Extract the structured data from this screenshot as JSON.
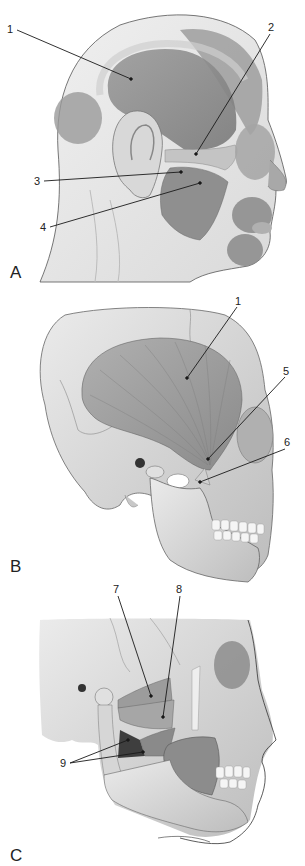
{
  "figure": {
    "panels": [
      {
        "id": "A",
        "label": "A",
        "description": "Lateral view of the head showing superficial facial muscles",
        "callouts": [
          {
            "number": "1",
            "x": 7,
            "y": 26,
            "target_x": 131,
            "target_y": 79
          },
          {
            "number": "2",
            "x": 268,
            "y": 26,
            "target_x": 196,
            "target_y": 154
          },
          {
            "number": "3",
            "x": 36,
            "y": 180,
            "target_x": 181,
            "target_y": 172
          },
          {
            "number": "4",
            "x": 42,
            "y": 227,
            "target_x": 200,
            "target_y": 183
          }
        ]
      },
      {
        "id": "B",
        "label": "B",
        "description": "Lateral view of the skull showing temporalis muscle",
        "callouts": [
          {
            "number": "1",
            "x": 236,
            "y": 298,
            "target_x": 187,
            "target_y": 378
          },
          {
            "number": "5",
            "x": 285,
            "y": 369,
            "target_x": 208,
            "target_y": 459
          },
          {
            "number": "6",
            "x": 286,
            "y": 440,
            "target_x": 200,
            "target_y": 482
          }
        ]
      },
      {
        "id": "C",
        "label": "C",
        "description": "Deep lateral view showing pterygoid muscles",
        "callouts": [
          {
            "number": "7",
            "x": 114,
            "y": 586,
            "target_x": 151,
            "target_y": 696
          },
          {
            "number": "8",
            "x": 176,
            "y": 586,
            "target_x": 163,
            "target_y": 717
          },
          {
            "number": "9",
            "x": 60,
            "y": 762,
            "target_x": 128,
            "target_y": 740
          },
          {
            "number": "9",
            "x": 60,
            "y": 762,
            "target_x": 143,
            "target_y": 752
          }
        ]
      }
    ],
    "colors": {
      "background": "#ffffff",
      "muscle_dark": "#8c8c8c",
      "muscle_mid": "#a8a8a8",
      "skin": "#e8e8e8",
      "bone": "#d6d6d6",
      "line": "#222222"
    }
  }
}
